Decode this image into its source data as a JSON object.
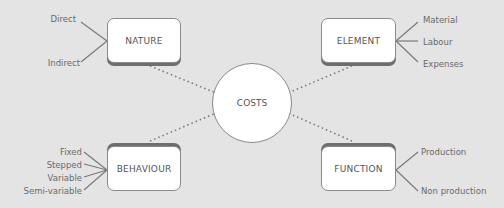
{
  "center": {
    "label": "COSTS"
  },
  "categories": [
    {
      "id": "nature",
      "label": "NATURE",
      "items": [
        "Direct",
        "Indirect"
      ]
    },
    {
      "id": "element",
      "label": "ELEMENT",
      "items": [
        "Material",
        "Labour",
        "Expenses"
      ]
    },
    {
      "id": "behaviour",
      "label": "BEHAVIOUR",
      "items": [
        "Fixed",
        "Stepped",
        "Variable",
        "Semi-variable"
      ]
    },
    {
      "id": "function",
      "label": "FUNCTION",
      "items": [
        "Production",
        "Non production"
      ]
    }
  ],
  "colors": {
    "background": "#e4e4e4",
    "box": "#ffffff",
    "border": "#8a8a8a",
    "text": "#555555",
    "connector": "#7a7a7a"
  }
}
